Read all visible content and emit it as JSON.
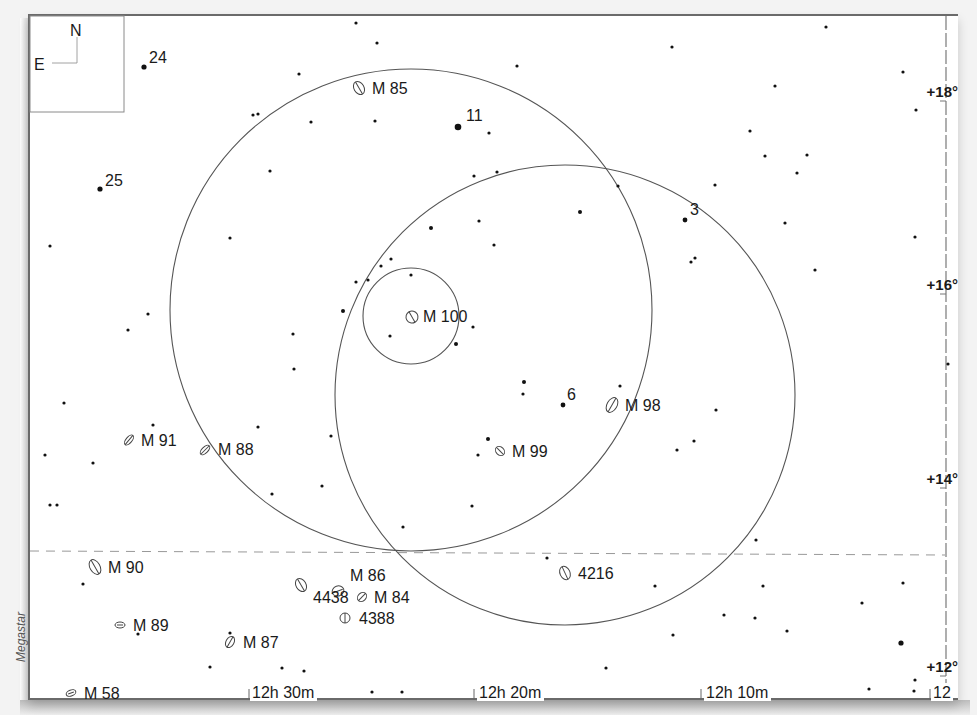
{
  "chart": {
    "credit": "Megastar",
    "compass": {
      "north": "N",
      "east": "E"
    },
    "dec_labels": [
      {
        "text": "+18°",
        "x": 958,
        "y": 97
      },
      {
        "text": "+16°",
        "x": 958,
        "y": 290
      },
      {
        "text": "+14°",
        "x": 958,
        "y": 484
      },
      {
        "text": "+12°",
        "x": 958,
        "y": 672
      }
    ],
    "ra_labels": [
      {
        "text": "12h 30m",
        "x": 252,
        "y": 699,
        "tick_x": 249
      },
      {
        "text": "12h 20m",
        "x": 479,
        "y": 699,
        "tick_x": 474
      },
      {
        "text": "12h 10m",
        "x": 706,
        "y": 699,
        "tick_x": 701
      },
      {
        "text": "12",
        "x": 933,
        "y": 699,
        "tick_x": 930
      }
    ],
    "ecliptic_line": {
      "y1": 551,
      "y2": 555,
      "style": "dashed"
    },
    "circles": [
      {
        "name": "finder-field-large-1",
        "cx": 411,
        "cy": 310,
        "r": 241
      },
      {
        "name": "finder-field-large-2",
        "cx": 565,
        "cy": 395,
        "r": 230
      },
      {
        "name": "eyepiece-field-small",
        "cx": 411,
        "cy": 316,
        "r": 48
      }
    ],
    "star_labels": [
      {
        "text": "24",
        "x": 149,
        "y": 63
      },
      {
        "text": "11",
        "x": 466,
        "y": 121
      },
      {
        "text": "25",
        "x": 105,
        "y": 186
      },
      {
        "text": "3",
        "x": 690,
        "y": 215
      },
      {
        "text": "6",
        "x": 567,
        "y": 400
      }
    ],
    "galaxies": [
      {
        "label": "M 85",
        "x": 359,
        "y": 88,
        "rx": 5,
        "ry": 7,
        "angle": -30,
        "lx": 372,
        "ly": 94
      },
      {
        "label": "M 100",
        "x": 412,
        "y": 317,
        "rx": 6,
        "ry": 6,
        "angle": -30,
        "lx": 423,
        "ly": 322
      },
      {
        "label": "M 98",
        "x": 612,
        "y": 405,
        "rx": 5,
        "ry": 8,
        "angle": 30,
        "lx": 625,
        "ly": 411
      },
      {
        "label": "M 91",
        "x": 129,
        "y": 440,
        "rx": 3,
        "ry": 6,
        "angle": 40,
        "lx": 141,
        "ly": 446
      },
      {
        "label": "M 88",
        "x": 205,
        "y": 450,
        "rx": 3,
        "ry": 6,
        "angle": 45,
        "lx": 218,
        "ly": 455
      },
      {
        "label": "M 99",
        "x": 500,
        "y": 451,
        "rx": 5,
        "ry": 4,
        "angle": 45,
        "lx": 512,
        "ly": 457
      },
      {
        "label": "M 90",
        "x": 95,
        "y": 567,
        "rx": 5,
        "ry": 8,
        "angle": -30,
        "lx": 108,
        "ly": 573
      },
      {
        "label": "4216",
        "x": 565,
        "y": 573,
        "rx": 5,
        "ry": 7,
        "angle": -25,
        "lx": 578,
        "ly": 579
      },
      {
        "label": "M 86",
        "x": 301,
        "y": 585,
        "rx": 5,
        "ry": 7,
        "angle": -30,
        "lx": 350,
        "ly": 581
      },
      {
        "label": "4438",
        "x": 338,
        "y": 591,
        "rx": 6,
        "ry": 5,
        "angle": -20,
        "lx": 313,
        "ly": 603
      },
      {
        "label": "M 84",
        "x": 362,
        "y": 597,
        "rx": 4,
        "ry": 5,
        "angle": 45,
        "lx": 374,
        "ly": 603
      },
      {
        "label": "4388",
        "x": 345,
        "y": 618,
        "rx": 5,
        "ry": 5,
        "angle": 0,
        "lx": 359,
        "ly": 624
      },
      {
        "label": "M 89",
        "x": 120,
        "y": 625,
        "rx": 5,
        "ry": 3,
        "angle": 0,
        "lx": 133,
        "ly": 631
      },
      {
        "label": "M 87",
        "x": 230,
        "y": 642,
        "rx": 4,
        "ry": 6,
        "angle": 30,
        "lx": 243,
        "ly": 648
      },
      {
        "label": "M 58",
        "x": 71,
        "y": 693,
        "rx": 5,
        "ry": 3,
        "angle": -20,
        "lx": 84,
        "ly": 699
      }
    ],
    "stars": [
      [
        144,
        67,
        2.6
      ],
      [
        356,
        23,
        1.6
      ],
      [
        377,
        43,
        1.6
      ],
      [
        299,
        74,
        1.6
      ],
      [
        253,
        115,
        1.6
      ],
      [
        258,
        114,
        1.6
      ],
      [
        311,
        122,
        1.6
      ],
      [
        375,
        121,
        1.6
      ],
      [
        458,
        127,
        3.3
      ],
      [
        489,
        133,
        1.6
      ],
      [
        517,
        66,
        1.6
      ],
      [
        672,
        47,
        1.6
      ],
      [
        826,
        27,
        1.6
      ],
      [
        775,
        86,
        1.6
      ],
      [
        750,
        131,
        1.6
      ],
      [
        903,
        72,
        1.6
      ],
      [
        916,
        110,
        1.6
      ],
      [
        100,
        189,
        2.6
      ],
      [
        50,
        246,
        1.6
      ],
      [
        230,
        238,
        1.6
      ],
      [
        270,
        171,
        1.6
      ],
      [
        474,
        176,
        1.6
      ],
      [
        497,
        172,
        1.6
      ],
      [
        431,
        228,
        2.0
      ],
      [
        479,
        221,
        1.6
      ],
      [
        494,
        245,
        1.6
      ],
      [
        580,
        212,
        2.0
      ],
      [
        618,
        186,
        1.6
      ],
      [
        685,
        220,
        2.4
      ],
      [
        715,
        185,
        1.6
      ],
      [
        691,
        262,
        1.6
      ],
      [
        695,
        258,
        1.6
      ],
      [
        765,
        156,
        1.6
      ],
      [
        807,
        155,
        1.6
      ],
      [
        797,
        173,
        1.6
      ],
      [
        785,
        223,
        1.6
      ],
      [
        815,
        270,
        1.6
      ],
      [
        915,
        237,
        1.6
      ],
      [
        128,
        330,
        1.6
      ],
      [
        148,
        314,
        1.6
      ],
      [
        356,
        282,
        1.6
      ],
      [
        368,
        280,
        1.6
      ],
      [
        381,
        266,
        1.6
      ],
      [
        391,
        259,
        1.6
      ],
      [
        411,
        275,
        1.6
      ],
      [
        343,
        311,
        2.0
      ],
      [
        293,
        334,
        1.6
      ],
      [
        294,
        369,
        1.6
      ],
      [
        390,
        336,
        1.6
      ],
      [
        456,
        344,
        2.0
      ],
      [
        473,
        327,
        1.6
      ],
      [
        524,
        382,
        2.0
      ],
      [
        523,
        394,
        1.6
      ],
      [
        563,
        405,
        2.4
      ],
      [
        716,
        410,
        1.6
      ],
      [
        694,
        441,
        1.6
      ],
      [
        677,
        450,
        1.6
      ],
      [
        620,
        386,
        1.6
      ],
      [
        64,
        403,
        1.6
      ],
      [
        45,
        455,
        1.6
      ],
      [
        93,
        463,
        1.6
      ],
      [
        153,
        425,
        1.6
      ],
      [
        258,
        427,
        1.6
      ],
      [
        331,
        436,
        1.6
      ],
      [
        322,
        486,
        1.6
      ],
      [
        272,
        494,
        1.6
      ],
      [
        488,
        439,
        2.0
      ],
      [
        478,
        455,
        1.6
      ],
      [
        472,
        506,
        1.6
      ],
      [
        403,
        527,
        1.6
      ],
      [
        50,
        505,
        1.6
      ],
      [
        57,
        505,
        1.6
      ],
      [
        948,
        364,
        1.6
      ],
      [
        756,
        540,
        1.6
      ],
      [
        83,
        584,
        1.6
      ],
      [
        138,
        634,
        1.6
      ],
      [
        230,
        633,
        1.6
      ],
      [
        210,
        667,
        1.6
      ],
      [
        282,
        668,
        1.6
      ],
      [
        304,
        671,
        1.6
      ],
      [
        372,
        692,
        1.6
      ],
      [
        402,
        692,
        1.6
      ],
      [
        547,
        558,
        1.6
      ],
      [
        655,
        586,
        1.6
      ],
      [
        724,
        615,
        1.6
      ],
      [
        673,
        635,
        1.6
      ],
      [
        606,
        668,
        1.6
      ],
      [
        763,
        586,
        1.6
      ],
      [
        755,
        618,
        1.6
      ],
      [
        787,
        631,
        1.6
      ],
      [
        862,
        603,
        1.6
      ],
      [
        903,
        583,
        1.6
      ],
      [
        901,
        643,
        2.6
      ],
      [
        915,
        680,
        1.6
      ],
      [
        869,
        689,
        1.6
      ],
      [
        914,
        691,
        1.6
      ]
    ]
  }
}
